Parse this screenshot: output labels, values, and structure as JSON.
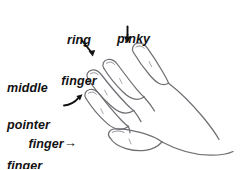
{
  "diagram": {
    "background_color": "#ffffff",
    "line_color": "#6f6f74",
    "text_color": "#111111"
  },
  "labels": {
    "ring": {
      "line1": "ring",
      "line2": "finger"
    },
    "pinky": {
      "line1": "pinky"
    },
    "middle": {
      "line1": "middle",
      "line2": "finger",
      "arrow_glyph": "→"
    },
    "pointer": {
      "line1": "pointer",
      "line2": "finger"
    }
  },
  "arrows": [
    {
      "name": "ring-finger-arrow",
      "direction": "down-right"
    },
    {
      "name": "pinky-arrow",
      "direction": "down"
    },
    {
      "name": "middle-finger-arrow",
      "direction": "right"
    },
    {
      "name": "pointer-finger-arrow",
      "direction": "up-right"
    }
  ],
  "hand": {
    "name": "left-hand-outline",
    "parts": [
      "pinky-finger",
      "ring-finger",
      "middle-finger",
      "pointer-finger",
      "thumb",
      "palm-back"
    ]
  }
}
